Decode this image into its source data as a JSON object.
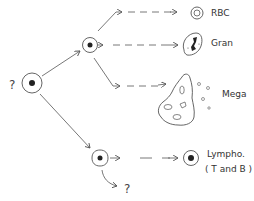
{
  "diagram": {
    "stem_cell": {
      "label": "?"
    },
    "myeloid_progenitor": {},
    "lymphoid_progenitor": {
      "unknown_label": "?"
    },
    "outputs": [
      {
        "id": "rbc",
        "label": "RBC"
      },
      {
        "id": "gran",
        "label": "Gran"
      },
      {
        "id": "mega",
        "label": "Mega"
      },
      {
        "id": "lympho",
        "label": "Lympho.",
        "sublabel": "( T and B )"
      }
    ],
    "colors": {
      "stroke": "#555555",
      "nucleus": "#222222",
      "background": "#ffffff"
    }
  }
}
